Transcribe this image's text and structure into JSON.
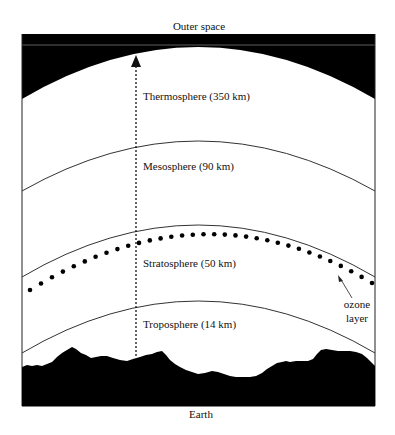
{
  "diagram": {
    "title_top": "Outer space",
    "title_bottom": "Earth",
    "layers": [
      {
        "name": "Thermosphere",
        "altitude": "350 km",
        "label": "Thermosphere (350 km)"
      },
      {
        "name": "Mesosphere",
        "altitude": "90 km",
        "label": "Mesosphere (90 km)"
      },
      {
        "name": "Stratosphere",
        "altitude": "50 km",
        "label": "Stratosphere (50 km)"
      },
      {
        "name": "Troposphere",
        "altitude": "14 km",
        "label": "Troposphere  (14 km)"
      }
    ],
    "ozone": {
      "line1": "ozone",
      "line2": "layer"
    },
    "colors": {
      "fill": "#000000",
      "line": "#333333",
      "background": "#ffffff"
    }
  }
}
